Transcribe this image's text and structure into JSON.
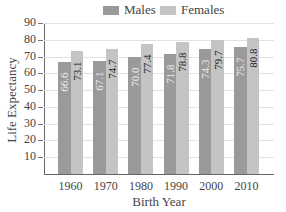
{
  "chart_data": {
    "type": "bar",
    "title": "",
    "xlabel": "Birth Year",
    "ylabel": "Life Expectancy",
    "categories": [
      "1960",
      "1970",
      "1980",
      "1990",
      "2000",
      "2010"
    ],
    "series": [
      {
        "name": "Males",
        "color": "#9a9a9a",
        "values": [
          66.6,
          67.1,
          70.0,
          71.8,
          74.3,
          75.7
        ],
        "labels": [
          "66.6",
          "67.1",
          "70.0",
          "71.8",
          "74.3",
          "75.7"
        ]
      },
      {
        "name": "Females",
        "color": "#c4c4c4",
        "values": [
          73.1,
          74.7,
          77.4,
          78.8,
          79.7,
          80.8
        ],
        "labels": [
          "73.1",
          "74.7",
          "77.4",
          "78.8",
          "79.7",
          "80.8"
        ]
      }
    ],
    "yticks": [
      "10",
      "20",
      "30",
      "40",
      "50",
      "60",
      "70",
      "80",
      "90"
    ],
    "ylim": [
      0,
      90
    ],
    "grid": true,
    "legend_position": "top"
  }
}
